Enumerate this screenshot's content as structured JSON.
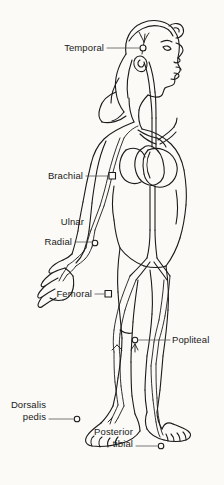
{
  "figure": {
    "background_color": "#fbfaf7",
    "line_color": "#1a1a1a",
    "width": 224,
    "height": 485
  },
  "labels": [
    {
      "id": "temporal",
      "text": "Temporal",
      "lines": [
        "Temporal"
      ],
      "align": "right",
      "x": 104,
      "y": 42,
      "leader": {
        "x1": 107,
        "y1": 48,
        "x2": 140,
        "y2": 48
      },
      "marker": {
        "type": "circle",
        "x": 143,
        "y": 48
      }
    },
    {
      "id": "brachial",
      "text": "Brachial",
      "lines": [
        "Brachial"
      ],
      "align": "right",
      "x": 83,
      "y": 170,
      "leader": {
        "x1": 86,
        "y1": 176,
        "x2": 109,
        "y2": 176
      },
      "marker": {
        "type": "square",
        "x": 112,
        "y": 176
      }
    },
    {
      "id": "ulnar",
      "text": "Ulnar",
      "lines": [
        "Ulnar"
      ],
      "align": "right",
      "x": 84,
      "y": 216,
      "leader": null,
      "marker": null
    },
    {
      "id": "radial",
      "text": "Radial",
      "lines": [
        "Radial"
      ],
      "align": "right",
      "x": 72,
      "y": 236,
      "leader": {
        "x1": 75,
        "y1": 242,
        "x2": 92,
        "y2": 242
      },
      "marker": {
        "type": "circle",
        "x": 95,
        "y": 243
      }
    },
    {
      "id": "femoral",
      "text": "Femoral",
      "lines": [
        "Femoral"
      ],
      "align": "right",
      "x": 92,
      "y": 288,
      "leader": {
        "x1": 95,
        "y1": 294,
        "x2": 105,
        "y2": 294
      },
      "marker": {
        "type": "square",
        "x": 108,
        "y": 294
      }
    },
    {
      "id": "popliteal",
      "text": "Popliteal",
      "lines": [
        "Popliteal"
      ],
      "align": "left",
      "x": 172,
      "y": 334,
      "leader": {
        "x1": 138,
        "y1": 340,
        "x2": 170,
        "y2": 340
      },
      "marker": {
        "type": "circle",
        "x": 135,
        "y": 340
      }
    },
    {
      "id": "dorsalis-pedis",
      "text": "Dorsalis pedis",
      "lines": [
        "Dorsalis",
        "pedis"
      ],
      "align": "right",
      "x": 46,
      "y": 399,
      "leader": {
        "x1": 49,
        "y1": 419,
        "x2": 74,
        "y2": 419
      },
      "marker": {
        "type": "circle",
        "x": 77,
        "y": 419
      }
    },
    {
      "id": "posterior-tibial",
      "text": "Posterior tibial",
      "lines": [
        "Posterior",
        "tibial"
      ],
      "align": "right",
      "x": 133,
      "y": 426,
      "leader": {
        "x1": 136,
        "y1": 446,
        "x2": 158,
        "y2": 446
      },
      "marker": {
        "type": "circle",
        "x": 161,
        "y": 446
      }
    }
  ]
}
